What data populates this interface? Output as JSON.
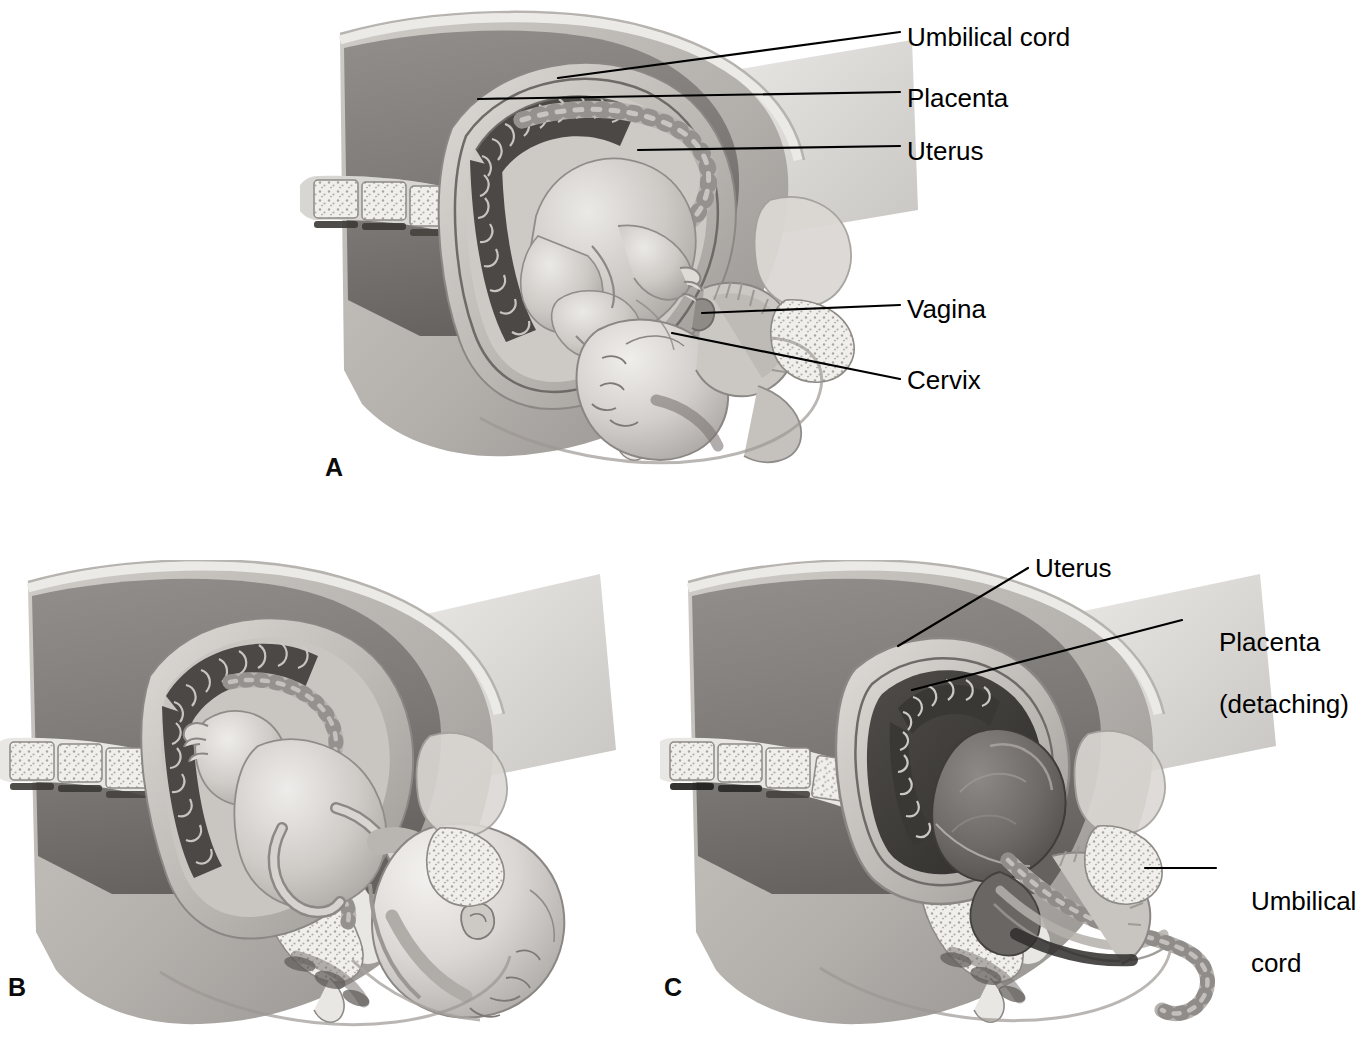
{
  "figure": {
    "type": "medical-illustration",
    "background_color": "#ffffff",
    "ink_color": "#000000",
    "rendering": "grayscale halftone line drawing"
  },
  "panels": [
    {
      "id": "A",
      "letter": "A",
      "caption": "Fetus in utero before labor",
      "labels": [
        {
          "id": "umbilical-cord",
          "text": "Umbilical cord"
        },
        {
          "id": "placenta",
          "text": "Placenta"
        },
        {
          "id": "uterus",
          "text": "Uterus"
        },
        {
          "id": "vagina",
          "text": "Vagina"
        },
        {
          "id": "cervix",
          "text": "Cervix"
        }
      ]
    },
    {
      "id": "B",
      "letter": "B",
      "caption": "Delivery of the fetus",
      "labels": []
    },
    {
      "id": "C",
      "letter": "C",
      "caption": "Delivery of the placenta",
      "labels": [
        {
          "id": "uterus",
          "text": "Uterus"
        },
        {
          "id": "placenta-detaching-line1",
          "text": "Placenta"
        },
        {
          "id": "placenta-detaching-line2",
          "text": "(detaching)"
        },
        {
          "id": "umbilical-cord-line1",
          "text": "Umbilical"
        },
        {
          "id": "umbilical-cord-line2",
          "text": "cord"
        }
      ]
    }
  ],
  "palette": {
    "paper": "#ffffff",
    "tissue_light": "#d9d6d2",
    "tissue_mid": "#b4b0ac",
    "tissue_dark": "#8e8a86",
    "cavity_dark": "#6f6b68",
    "cavity_darkest": "#4a4745",
    "bone_light": "#efedea",
    "bone_speckle": "#a9a5a1",
    "fetus_light": "#dedbd7",
    "fetus_mid": "#bcb8b4",
    "outline": "#5a5754",
    "leader_line": "#000000"
  }
}
